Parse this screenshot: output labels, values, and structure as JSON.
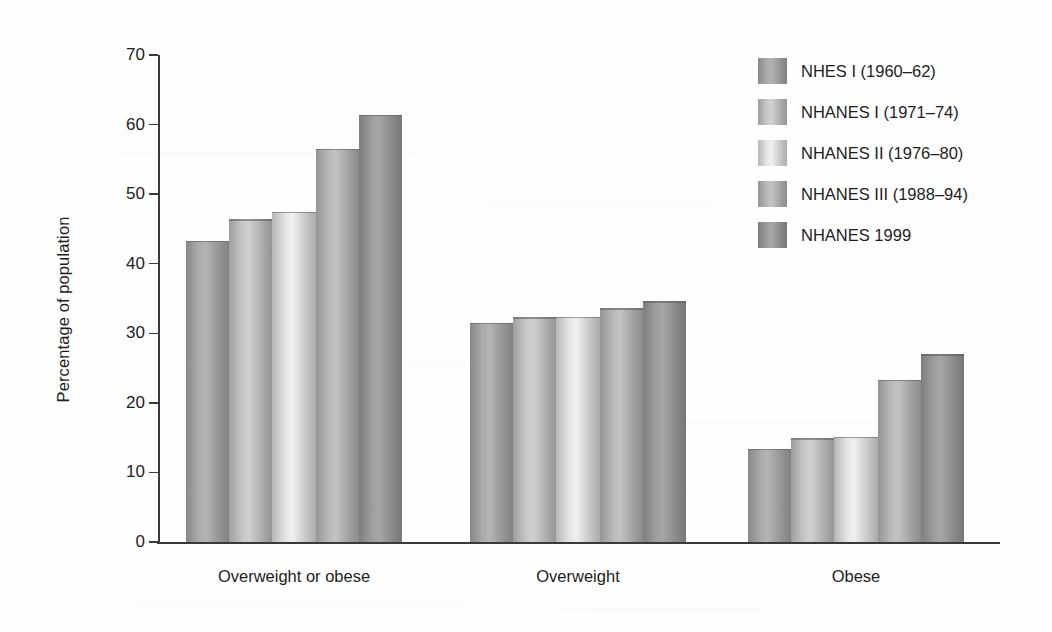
{
  "chart_data": {
    "type": "bar",
    "title": "",
    "subtitle": "",
    "xlabel": "",
    "ylabel": "Percentage of population",
    "categories": [
      "Overweight or obese",
      "Overweight",
      "Obese"
    ],
    "ylim": [
      0,
      70
    ],
    "yticks": [
      0,
      10,
      20,
      30,
      40,
      50,
      60,
      70
    ],
    "ytick_labels": [
      "0",
      "10",
      "20",
      "30",
      "40",
      "50",
      "60",
      "70"
    ],
    "grid": false,
    "legend_position": "top-right",
    "series": [
      {
        "name": "NHES I (1960–62)",
        "values": [
          43.3,
          31.5,
          13.4
        ],
        "color": "#9b9b9b"
      },
      {
        "name": "NHANES I (1971–74)",
        "values": [
          46.4,
          32.3,
          14.9
        ],
        "color": "#b4b4b4"
      },
      {
        "name": "NHANES II (1976–80)",
        "values": [
          47.5,
          32.4,
          15.1
        ],
        "color": "#cfcfcf"
      },
      {
        "name": "NHANES III (1988–94)",
        "values": [
          56.5,
          33.6,
          23.3
        ],
        "color": "#a8a8a8"
      },
      {
        "name": "NHANES 1999",
        "values": [
          61.4,
          34.6,
          27.0
        ],
        "color": "#8f8f8f"
      }
    ]
  },
  "legend": {
    "items": [
      {
        "label": "NHES I (1960–62)"
      },
      {
        "label": "NHANES I (1971–74)"
      },
      {
        "label": "NHANES II (1976–80)"
      },
      {
        "label": "NHANES III (1988–94)"
      },
      {
        "label": "NHANES 1999"
      }
    ]
  },
  "axes": {
    "y_title": "Percentage of population"
  }
}
